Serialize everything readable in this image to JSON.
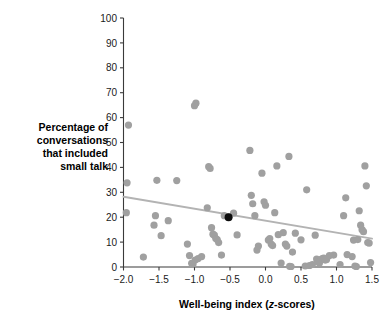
{
  "chart_data": {
    "type": "scatter",
    "title": "",
    "xlabel": "Well-being index (z-scores)",
    "xlabel_parts": {
      "before": "Well-being index (",
      "italic": "z",
      "after": "-scores)"
    },
    "ylabel": "Percentage of conversations that included small talk",
    "ylabel_lines": [
      "Percentage of",
      "conversations",
      "that included",
      "small talk"
    ],
    "xlim": [
      -2.0,
      1.5
    ],
    "ylim": [
      0,
      100
    ],
    "xticks": [
      -2.0,
      -1.5,
      -1.0,
      -0.5,
      0.0,
      0.5,
      1.0,
      1.5
    ],
    "xtick_labels": [
      "−2.0",
      "−1.5",
      "−1.0",
      "−0.5",
      "0.0",
      "0.5",
      "1.0",
      "1.5"
    ],
    "yticks": [
      0,
      10,
      20,
      30,
      40,
      50,
      60,
      70,
      80,
      90,
      100
    ],
    "ytick_labels": [
      "0",
      "10",
      "20",
      "30",
      "40",
      "50",
      "60",
      "70",
      "80",
      "90",
      "100"
    ],
    "grid": false,
    "legend": "none",
    "point_color": "#a0a0a0",
    "highlight_color": "#0d0d0d",
    "line_color": "#b3b3b3",
    "trend_line": {
      "name": "regression line",
      "x": [
        -2.0,
        1.5
      ],
      "y": [
        28.2,
        11.4
      ]
    },
    "series": [
      {
        "name": "participants",
        "marker": "circle",
        "color": "#a0a0a0",
        "points": [
          [
            -1.93,
            57.0
          ],
          [
            -1.95,
            33.8
          ],
          [
            -1.96,
            21.8
          ],
          [
            -1.72,
            4.0
          ],
          [
            -1.53,
            34.8
          ],
          [
            -1.55,
            20.6
          ],
          [
            -1.57,
            16.8
          ],
          [
            -1.47,
            12.6
          ],
          [
            -1.37,
            18.6
          ],
          [
            -1.25,
            34.7
          ],
          [
            -1.1,
            9.2
          ],
          [
            -1.07,
            4.6
          ],
          [
            -1.04,
            1.5
          ],
          [
            -1.02,
            1.2
          ],
          [
            -0.99,
            2.8
          ],
          [
            -0.98,
            65.8
          ],
          [
            -1.0,
            64.8
          ],
          [
            -0.95,
            3.4
          ],
          [
            -0.9,
            4.2
          ],
          [
            -0.82,
            23.8
          ],
          [
            -0.8,
            40.3
          ],
          [
            -0.78,
            39.6
          ],
          [
            -0.76,
            15.8
          ],
          [
            -0.74,
            13.2
          ],
          [
            -0.72,
            12.8
          ],
          [
            -0.7,
            11.4
          ],
          [
            -0.68,
            11.0
          ],
          [
            -0.66,
            9.8
          ],
          [
            -0.62,
            4.8
          ],
          [
            -0.58,
            20.6
          ],
          [
            -0.52,
            20.0
          ],
          [
            -0.45,
            21.6
          ],
          [
            -0.4,
            12.9
          ],
          [
            -0.22,
            46.8
          ],
          [
            -0.2,
            28.8
          ],
          [
            -0.18,
            25.4
          ],
          [
            -0.15,
            20.6
          ],
          [
            -0.12,
            6.8
          ],
          [
            -0.1,
            8.4
          ],
          [
            -0.05,
            37.7
          ],
          [
            -0.02,
            26.2
          ],
          [
            0.0,
            24.8
          ],
          [
            0.04,
            10.8
          ],
          [
            0.06,
            11.4
          ],
          [
            0.08,
            9.2
          ],
          [
            0.1,
            8.6
          ],
          [
            0.13,
            21.8
          ],
          [
            0.16,
            40.6
          ],
          [
            0.18,
            13.0
          ],
          [
            0.22,
            1.6
          ],
          [
            0.25,
            13.8
          ],
          [
            0.28,
            9.2
          ],
          [
            0.3,
            8.4
          ],
          [
            0.33,
            44.4
          ],
          [
            0.34,
            0.3
          ],
          [
            0.36,
            0.2
          ],
          [
            0.38,
            6.0
          ],
          [
            0.42,
            13.6
          ],
          [
            0.5,
            10.9
          ],
          [
            0.56,
            0.4
          ],
          [
            0.58,
            31.0
          ],
          [
            0.62,
            0.6
          ],
          [
            0.66,
            1.0
          ],
          [
            0.7,
            12.8
          ],
          [
            0.72,
            3.2
          ],
          [
            0.74,
            2.0
          ],
          [
            0.76,
            1.6
          ],
          [
            0.78,
            3.0
          ],
          [
            0.8,
            3.4
          ],
          [
            0.82,
            3.6
          ],
          [
            0.84,
            2.8
          ],
          [
            0.86,
            3.0
          ],
          [
            0.9,
            4.6
          ],
          [
            0.96,
            4.8
          ],
          [
            1.05,
            1.0
          ],
          [
            1.1,
            20.6
          ],
          [
            1.13,
            27.8
          ],
          [
            1.15,
            5.0
          ],
          [
            1.22,
            4.2
          ],
          [
            1.24,
            10.8
          ],
          [
            1.26,
            0.4
          ],
          [
            1.28,
            0.2
          ],
          [
            1.3,
            11.0
          ],
          [
            1.32,
            22.6
          ],
          [
            1.34,
            16.8
          ],
          [
            1.36,
            15.0
          ],
          [
            1.38,
            14.2
          ],
          [
            1.4,
            40.6
          ],
          [
            1.42,
            32.6
          ],
          [
            1.44,
            9.8
          ],
          [
            1.46,
            9.6
          ],
          [
            1.48,
            1.8
          ]
        ]
      },
      {
        "name": "highlighted participant",
        "marker": "circle",
        "color": "#0d0d0d",
        "points": [
          [
            -0.52,
            20.0
          ]
        ]
      }
    ]
  }
}
